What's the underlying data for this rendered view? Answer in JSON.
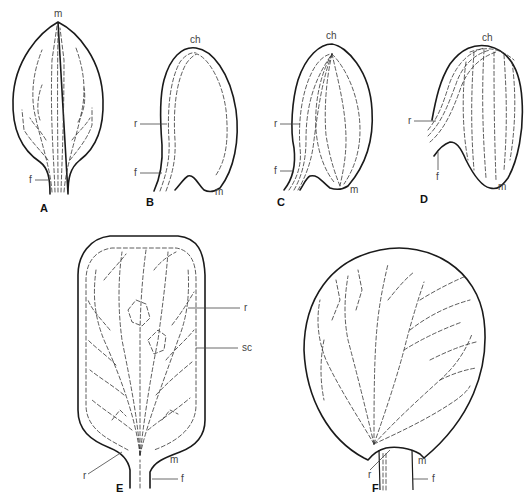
{
  "figure": {
    "type": "botanical venation diagram",
    "panels": [
      {
        "id": "A",
        "label": "A",
        "annotations": [
          {
            "text": "m"
          },
          {
            "text": "f"
          }
        ]
      },
      {
        "id": "B",
        "label": "B",
        "annotations": [
          {
            "text": "ch"
          },
          {
            "text": "r"
          },
          {
            "text": "f"
          },
          {
            "text": "m"
          }
        ]
      },
      {
        "id": "C",
        "label": "C",
        "annotations": [
          {
            "text": "ch"
          },
          {
            "text": "r"
          },
          {
            "text": "f"
          },
          {
            "text": "m"
          }
        ]
      },
      {
        "id": "D",
        "label": "D",
        "annotations": [
          {
            "text": "ch"
          },
          {
            "text": "r"
          },
          {
            "text": "f"
          },
          {
            "text": "m"
          }
        ]
      },
      {
        "id": "E",
        "label": "E",
        "annotations": [
          {
            "text": "r"
          },
          {
            "text": "sc"
          },
          {
            "text": "r"
          },
          {
            "text": "m"
          },
          {
            "text": "f"
          }
        ]
      },
      {
        "id": "F",
        "label": "F",
        "annotations": [
          {
            "text": "r"
          },
          {
            "text": "m"
          },
          {
            "text": "f"
          }
        ]
      }
    ]
  }
}
